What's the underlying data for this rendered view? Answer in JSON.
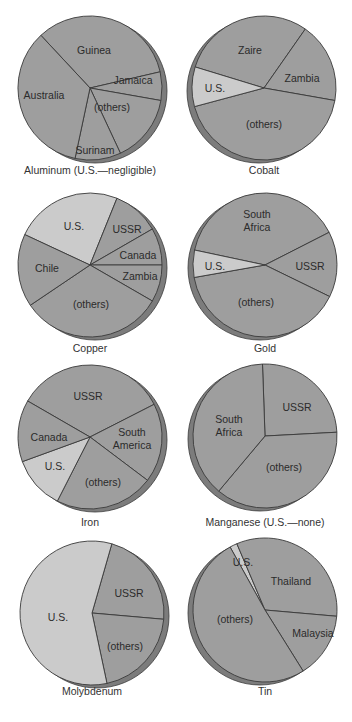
{
  "colors": {
    "dark_slice": "#9e9e9e",
    "light_slice": "#cbcbcb",
    "rim": "#7c7c7c",
    "outline": "#3a3a3a"
  },
  "chart_data": [
    {
      "type": "pie",
      "title": "Aluminum (U.S.—negligible)",
      "slices": [
        {
          "label": "Guinea",
          "value": 33,
          "start": -43,
          "end": 77,
          "shade": "dark"
        },
        {
          "label": "Jamaica",
          "value": 6,
          "start": 77,
          "end": 100,
          "shade": "dark"
        },
        {
          "label": "(others)",
          "value": 15,
          "start": 100,
          "end": 155,
          "shade": "dark"
        },
        {
          "label": "Surinam",
          "value": 10,
          "start": 155,
          "end": 192,
          "shade": "dark"
        },
        {
          "label": "Australia",
          "value": 36,
          "start": 192,
          "end": 317,
          "shade": "dark"
        }
      ],
      "layout": {
        "cx": 90,
        "cy": 88,
        "r": 72,
        "rim": "right",
        "caption_y": 167,
        "labels": [
          [
            94,
            50
          ],
          [
            133,
            80
          ],
          [
            112,
            107
          ],
          [
            95,
            150
          ],
          [
            44,
            95
          ]
        ]
      }
    },
    {
      "type": "pie",
      "title": "Cobalt",
      "slices": [
        {
          "label": "Zaire",
          "value": 30,
          "start": -73,
          "end": 35,
          "shade": "dark"
        },
        {
          "label": "Zambia",
          "value": 18,
          "start": 35,
          "end": 100,
          "shade": "dark"
        },
        {
          "label": "(others)",
          "value": 43,
          "start": 100,
          "end": 255,
          "shade": "dark"
        },
        {
          "label": "U.S.",
          "value": 9,
          "start": 255,
          "end": 287,
          "shade": "light"
        }
      ],
      "layout": {
        "cx": 264,
        "cy": 88,
        "r": 72,
        "rim": "left",
        "caption_y": 167,
        "labels": [
          [
            250,
            50
          ],
          [
            302,
            78
          ],
          [
            264,
            124
          ],
          [
            215,
            88
          ]
        ]
      }
    },
    {
      "type": "pie",
      "title": "Copper",
      "slices": [
        {
          "label": "U.S.",
          "value": 24,
          "start": -65,
          "end": 22,
          "shade": "light"
        },
        {
          "label": "USSR",
          "value": 11,
          "start": 22,
          "end": 60,
          "shade": "dark"
        },
        {
          "label": "Canada",
          "value": 8,
          "start": 60,
          "end": 90,
          "shade": "dark"
        },
        {
          "label": "Zambia",
          "value": 8,
          "start": 90,
          "end": 120,
          "shade": "dark"
        },
        {
          "label": "(others)",
          "value": 32,
          "start": 120,
          "end": 236,
          "shade": "dark"
        },
        {
          "label": "Chile",
          "value": 17,
          "start": 236,
          "end": 295,
          "shade": "dark"
        }
      ],
      "layout": {
        "cx": 90,
        "cy": 265,
        "r": 72,
        "rim": "right",
        "caption_y": 345,
        "labels": [
          [
            74,
            226
          ],
          [
            127,
            229
          ],
          [
            138,
            255
          ],
          [
            140,
            276
          ],
          [
            91,
            304
          ],
          [
            47,
            268
          ]
        ]
      }
    },
    {
      "type": "pie",
      "title": "Gold",
      "slices": [
        {
          "label": "South Africa",
          "value": 39,
          "start": -78,
          "end": 63,
          "shade": "dark"
        },
        {
          "label": "USSR",
          "value": 15,
          "start": 63,
          "end": 116,
          "shade": "dark"
        },
        {
          "label": "(others)",
          "value": 40,
          "start": 116,
          "end": 260,
          "shade": "dark"
        },
        {
          "label": "U.S.",
          "value": 6,
          "start": 260,
          "end": 282,
          "shade": "light"
        }
      ],
      "layout": {
        "cx": 265,
        "cy": 265,
        "r": 72,
        "rim": "left",
        "caption_y": 345,
        "labels": [
          [
            257,
            222
          ],
          [
            310,
            266
          ],
          [
            256,
            302
          ],
          [
            215,
            266
          ]
        ]
      }
    },
    {
      "type": "pie",
      "title": "Iron",
      "slices": [
        {
          "label": "USSR",
          "value": 25,
          "start": -60,
          "end": 63,
          "shade": "dark"
        },
        {
          "label": "South America",
          "value": 18,
          "start": 63,
          "end": 127,
          "shade": "dark"
        },
        {
          "label": "(others)",
          "value": 22,
          "start": 127,
          "end": 207,
          "shade": "dark"
        },
        {
          "label": "U.S.",
          "value": 12,
          "start": 207,
          "end": 250,
          "shade": "light"
        },
        {
          "label": "Canada",
          "value": 14,
          "start": 250,
          "end": 300,
          "shade": "dark"
        }
      ],
      "layout": {
        "cx": 90,
        "cy": 437,
        "r": 72,
        "rim": "right",
        "caption_y": 519,
        "labels": [
          [
            88,
            396
          ],
          [
            132,
            440
          ],
          [
            103,
            482
          ],
          [
            55,
            466
          ],
          [
            49,
            437
          ]
        ]
      }
    },
    {
      "type": "pie",
      "title": "Manganese (U.S.—none)",
      "slices": [
        {
          "label": "USSR",
          "value": 25,
          "start": -2,
          "end": 87,
          "shade": "dark"
        },
        {
          "label": "(others)",
          "value": 37,
          "start": 87,
          "end": 220,
          "shade": "dark"
        },
        {
          "label": "South Africa",
          "value": 38,
          "start": 220,
          "end": 358,
          "shade": "dark"
        }
      ],
      "layout": {
        "cx": 265,
        "cy": 436,
        "r": 72,
        "rim": "left",
        "caption_y": 519,
        "labels": [
          [
            297,
            407
          ],
          [
            284,
            467
          ],
          [
            229,
            427
          ]
        ]
      }
    },
    {
      "type": "pie",
      "title": "Molybdenum",
      "slices": [
        {
          "label": "USSR",
          "value": 22,
          "start": 16,
          "end": 95,
          "shade": "dark"
        },
        {
          "label": "(others)",
          "value": 20,
          "start": 95,
          "end": 168,
          "shade": "dark"
        },
        {
          "label": "U.S.",
          "value": 58,
          "start": 168,
          "end": 376,
          "shade": "light"
        }
      ],
      "layout": {
        "cx": 92,
        "cy": 613,
        "r": 72,
        "rim": "right",
        "caption_y": 688,
        "labels": [
          [
            129,
            593
          ],
          [
            125,
            646
          ],
          [
            58,
            617
          ]
        ]
      }
    },
    {
      "type": "pie",
      "title": "Tin",
      "slices": [
        {
          "label": "U.S.",
          "value": 2,
          "start": -29,
          "end": -23,
          "shade": "light"
        },
        {
          "label": "Thailand",
          "value": 33,
          "start": -23,
          "end": 95,
          "shade": "dark"
        },
        {
          "label": "Malaysia",
          "value": 15,
          "start": 95,
          "end": 148,
          "shade": "dark"
        },
        {
          "label": "(others)",
          "value": 50,
          "start": 148,
          "end": 331,
          "shade": "dark"
        }
      ],
      "layout": {
        "cx": 265,
        "cy": 610,
        "r": 72,
        "rim": "left",
        "caption_y": 688,
        "labels": [
          [
            243,
            562
          ],
          [
            291,
            581
          ],
          [
            313,
            633
          ],
          [
            235,
            619
          ]
        ]
      }
    }
  ]
}
